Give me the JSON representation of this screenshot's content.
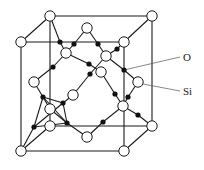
{
  "diagram": {
    "colors": {
      "line": "#1a1a1a",
      "si_fill": "#ffffff",
      "o_fill": "#111111",
      "label": "#222222"
    },
    "labels": [
      {
        "id": "O",
        "text": "O",
        "x": 183,
        "y": 61,
        "pointer_to": [
          124,
          70
        ]
      },
      {
        "id": "Si",
        "text": "Si",
        "x": 183,
        "y": 95,
        "pointer_to": [
          143,
          84
        ]
      }
    ],
    "cube": {
      "front": [
        [
          21,
          42
        ],
        [
          124,
          42
        ],
        [
          124,
          151
        ],
        [
          21,
          151
        ]
      ],
      "back": [
        [
          50,
          16
        ],
        [
          152,
          16
        ],
        [
          152,
          126
        ],
        [
          50,
          126
        ]
      ]
    },
    "si_atoms": [
      [
        50,
        16
      ],
      [
        152,
        16
      ],
      [
        21,
        42
      ],
      [
        124,
        42
      ],
      [
        152,
        126
      ],
      [
        21,
        151
      ],
      [
        124,
        151
      ],
      [
        50,
        126
      ],
      [
        87,
        28
      ],
      [
        66,
        53
      ],
      [
        106,
        56
      ],
      [
        101,
        72
      ],
      [
        34,
        82
      ],
      [
        73,
        95
      ],
      [
        138,
        82
      ],
      [
        123,
        106
      ],
      [
        50,
        109
      ],
      [
        87,
        137
      ]
    ],
    "o_atoms": [
      [
        60,
        42
      ],
      [
        74,
        44
      ],
      [
        98,
        44
      ],
      [
        117,
        49
      ],
      [
        53,
        67
      ],
      [
        89,
        64
      ],
      [
        90,
        74
      ],
      [
        124,
        70
      ],
      [
        43,
        97
      ],
      [
        63,
        103
      ],
      [
        115,
        94
      ],
      [
        128,
        97
      ],
      [
        34,
        127
      ],
      [
        67,
        123
      ],
      [
        103,
        122
      ],
      [
        138,
        115
      ]
    ],
    "bonds": [
      [
        [
          50,
          16
        ],
        [
          60,
          42
        ]
      ],
      [
        [
          60,
          42
        ],
        [
          66,
          53
        ]
      ],
      [
        [
          66,
          53
        ],
        [
          74,
          44
        ]
      ],
      [
        [
          74,
          44
        ],
        [
          87,
          28
        ]
      ],
      [
        [
          87,
          28
        ],
        [
          98,
          44
        ]
      ],
      [
        [
          98,
          44
        ],
        [
          106,
          56
        ]
      ],
      [
        [
          106,
          56
        ],
        [
          117,
          49
        ]
      ],
      [
        [
          117,
          49
        ],
        [
          124,
          42
        ]
      ],
      [
        [
          66,
          53
        ],
        [
          89,
          64
        ]
      ],
      [
        [
          89,
          64
        ],
        [
          101,
          72
        ]
      ],
      [
        [
          66,
          53
        ],
        [
          53,
          67
        ]
      ],
      [
        [
          53,
          67
        ],
        [
          34,
          82
        ]
      ],
      [
        [
          106,
          56
        ],
        [
          90,
          74
        ]
      ],
      [
        [
          90,
          74
        ],
        [
          73,
          95
        ]
      ],
      [
        [
          106,
          56
        ],
        [
          124,
          70
        ]
      ],
      [
        [
          124,
          70
        ],
        [
          138,
          82
        ]
      ],
      [
        [
          101,
          72
        ],
        [
          115,
          94
        ]
      ],
      [
        [
          115,
          94
        ],
        [
          123,
          106
        ]
      ],
      [
        [
          138,
          82
        ],
        [
          128,
          97
        ]
      ],
      [
        [
          128,
          97
        ],
        [
          123,
          106
        ]
      ],
      [
        [
          34,
          82
        ],
        [
          43,
          97
        ]
      ],
      [
        [
          43,
          97
        ],
        [
          63,
          103
        ]
      ],
      [
        [
          63,
          103
        ],
        [
          73,
          95
        ]
      ],
      [
        [
          43,
          97
        ],
        [
          50,
          109
        ]
      ],
      [
        [
          123,
          106
        ],
        [
          138,
          115
        ]
      ],
      [
        [
          138,
          115
        ],
        [
          152,
          126
        ]
      ],
      [
        [
          123,
          106
        ],
        [
          103,
          122
        ]
      ],
      [
        [
          103,
          122
        ],
        [
          87,
          137
        ]
      ],
      [
        [
          87,
          137
        ],
        [
          67,
          123
        ]
      ],
      [
        [
          67,
          123
        ],
        [
          50,
          109
        ]
      ],
      [
        [
          34,
          127
        ],
        [
          21,
          151
        ]
      ],
      [
        [
          34,
          127
        ],
        [
          43,
          97
        ]
      ],
      [
        [
          34,
          127
        ],
        [
          67,
          123
        ]
      ],
      [
        [
          34,
          127
        ],
        [
          63,
          103
        ]
      ],
      [
        [
          43,
          97
        ],
        [
          67,
          123
        ]
      ],
      [
        [
          63,
          103
        ],
        [
          67,
          123
        ]
      ],
      [
        [
          21,
          42
        ],
        [
          50,
          16
        ]
      ],
      [
        [
          124,
          42
        ],
        [
          152,
          16
        ]
      ],
      [
        [
          124,
          151
        ],
        [
          152,
          126
        ]
      ],
      [
        [
          21,
          151
        ],
        [
          50,
          126
        ]
      ]
    ]
  }
}
